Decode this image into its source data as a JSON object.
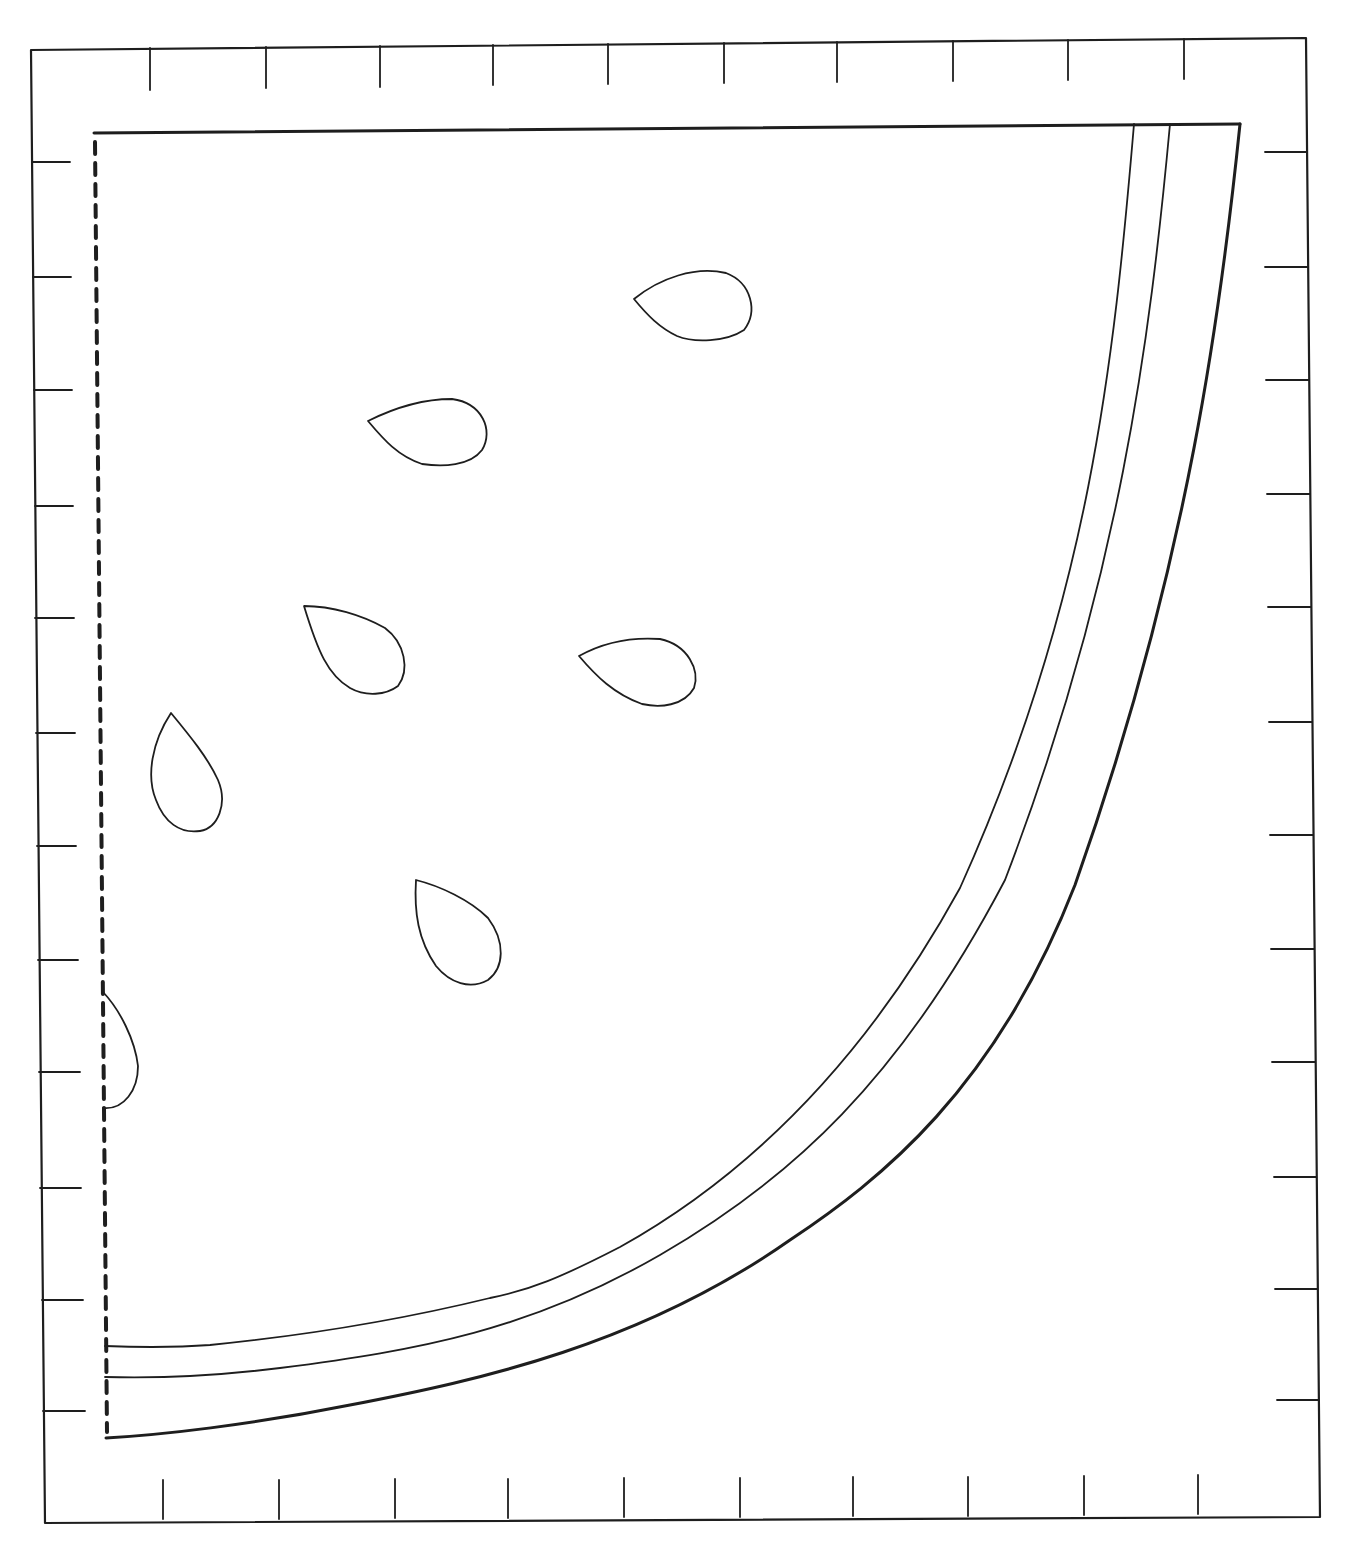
{
  "page": {
    "width": 1350,
    "height": 1549,
    "background": "#ffffff",
    "line_color": "#1e1e1e"
  },
  "frame": {
    "outline": [
      [
        31,
        50
      ],
      [
        1306,
        38
      ],
      [
        1320,
        1517
      ],
      [
        45,
        1523
      ]
    ],
    "stroke_width": 2.2,
    "top_ticks": [
      [
        150,
        48,
        150,
        90
      ],
      [
        266,
        47,
        266,
        88
      ],
      [
        380,
        46,
        380,
        87
      ],
      [
        493,
        45,
        493,
        85
      ],
      [
        608,
        44,
        608,
        84
      ],
      [
        724,
        43,
        724,
        83
      ],
      [
        837,
        42,
        837,
        82
      ],
      [
        953,
        41,
        953,
        81
      ],
      [
        1068,
        40,
        1068,
        80
      ],
      [
        1184,
        39,
        1184,
        79
      ]
    ],
    "left_ticks": [
      [
        33,
        162,
        70,
        162
      ],
      [
        33,
        277,
        71,
        277
      ],
      [
        34,
        390,
        72,
        390
      ],
      [
        35,
        506,
        73,
        506
      ],
      [
        35,
        618,
        74,
        618
      ],
      [
        36,
        733,
        75,
        733
      ],
      [
        37,
        846,
        76,
        846
      ],
      [
        38,
        960,
        78,
        960
      ],
      [
        39,
        1072,
        80,
        1072
      ],
      [
        40,
        1188,
        81,
        1188
      ],
      [
        42,
        1300,
        83,
        1300
      ],
      [
        43,
        1411,
        85,
        1411
      ]
    ],
    "right_ticks": [
      [
        1265,
        152,
        1307,
        152
      ],
      [
        1265,
        267,
        1308,
        267
      ],
      [
        1266,
        380,
        1309,
        380
      ],
      [
        1267,
        494,
        1310,
        494
      ],
      [
        1268,
        607,
        1311,
        607
      ],
      [
        1269,
        722,
        1312,
        722
      ],
      [
        1270,
        835,
        1313,
        835
      ],
      [
        1271,
        949,
        1314,
        949
      ],
      [
        1272,
        1062,
        1315,
        1062
      ],
      [
        1274,
        1177,
        1316,
        1177
      ],
      [
        1275,
        1289,
        1317,
        1289
      ],
      [
        1277,
        1400,
        1318,
        1400
      ]
    ],
    "bottom_ticks": [
      [
        163,
        1480,
        163,
        1519
      ],
      [
        279,
        1480,
        279,
        1519
      ],
      [
        395,
        1479,
        395,
        1518
      ],
      [
        508,
        1479,
        508,
        1518
      ],
      [
        624,
        1478,
        624,
        1517
      ],
      [
        740,
        1478,
        740,
        1517
      ],
      [
        853,
        1477,
        853,
        1516
      ],
      [
        968,
        1477,
        968,
        1516
      ],
      [
        1084,
        1476,
        1084,
        1515
      ],
      [
        1198,
        1475,
        1198,
        1514
      ]
    ],
    "tick_stroke_width": 1.8
  },
  "watermelon": {
    "fold_line": {
      "x1": 95,
      "y1": 142,
      "x2": 107,
      "y2": 1432,
      "dash": "12 9",
      "stroke_width": 4
    },
    "top_edge": "M94,133 L1240,124",
    "outer_rind": "M1240,124 C1222,300 1190,560 1075,885 C995,1090 880,1180 790,1240 C640,1345 480,1380 350,1405 C250,1425 160,1435 106,1438",
    "middle_rind": "M1170,124 C1150,340 1120,580 1005,880 C900,1080 790,1180 660,1255 C530,1330 420,1350 280,1368 C200,1378 140,1378 105,1377",
    "inner_rind": "M1134,124 C1114,360 1090,600 960,888 C860,1070 740,1180 620,1247 C560,1278 530,1290 490,1298 C400,1320 310,1335 210,1345 C170,1348 130,1347 105,1346",
    "outer_stroke_width": 3,
    "inner_stroke_width": 1.8,
    "seeds": [
      "M634,299 C660,278 695,266 726,273 C752,283 758,312 744,330 C726,342 694,343 677,336 C660,328 648,316 634,299 Z",
      "M368,421 C396,407 424,399 452,399 C482,403 494,430 482,450 C470,466 443,467 422,464 C398,456 384,440 368,421 Z",
      "M304,606 C332,606 362,615 385,628 C405,643 410,670 398,686 C386,695 366,697 350,688 C328,675 318,652 304,606 Z",
      "M579,656 C604,642 632,637 660,639 C688,645 700,670 694,688 C684,706 660,708 642,704 C614,694 596,676 579,656 Z",
      "M171,713 C190,736 208,758 218,780 C228,804 218,828 200,831 C180,834 164,822 156,800 C146,776 152,742 171,713 Z",
      "M416,880 C440,886 470,900 488,918 C506,942 504,968 488,980 C470,990 450,983 436,966 C418,940 414,912 416,880 Z",
      "M103,992 C120,1010 135,1040 138,1066 C138,1090 124,1110 103,1108"
    ],
    "seed_stroke_width": 1.8
  }
}
